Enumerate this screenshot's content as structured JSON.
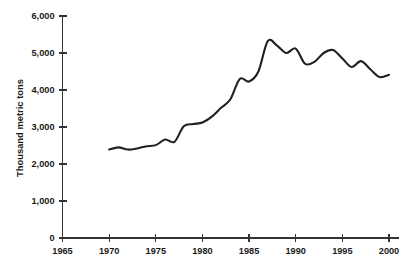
{
  "chart_data": {
    "type": "line",
    "title": "",
    "subtitle": "",
    "xlabel": "",
    "ylabel": "Thousand metric tons",
    "xlim": [
      1965,
      2001
    ],
    "ylim": [
      0,
      6000
    ],
    "grid": false,
    "legend": "none",
    "x_ticks": [
      "1965",
      "1970",
      "1975",
      "1980",
      "1985",
      "1990",
      "1995",
      "2000"
    ],
    "x_tick_values": [
      1965,
      1970,
      1975,
      1980,
      1985,
      1990,
      1995,
      2000
    ],
    "y_ticks": [
      "0",
      "1,000",
      "2,000",
      "3,000",
      "4,000",
      "5,000",
      "6,000"
    ],
    "y_tick_values": [
      0,
      1000,
      2000,
      3000,
      4000,
      5000,
      6000
    ],
    "series": [
      {
        "name": "Thousand metric tons",
        "color": "#231f20",
        "x": [
          1970,
          1971,
          1972,
          1973,
          1974,
          1975,
          1976,
          1977,
          1978,
          1979,
          1980,
          1981,
          1982,
          1983,
          1984,
          1985,
          1986,
          1987,
          1988,
          1989,
          1990,
          1991,
          1992,
          1993,
          1994,
          1995,
          1996,
          1997,
          1998,
          1999,
          2000
        ],
        "values": [
          2390,
          2450,
          2390,
          2420,
          2480,
          2510,
          2660,
          2600,
          3020,
          3080,
          3120,
          3280,
          3520,
          3750,
          4300,
          4230,
          4500,
          5320,
          5200,
          5000,
          5120,
          4710,
          4760,
          5000,
          5080,
          4850,
          4620,
          4780,
          4560,
          4350,
          4410
        ]
      }
    ]
  },
  "axis": {
    "y_title": "Thousand metric tons"
  }
}
